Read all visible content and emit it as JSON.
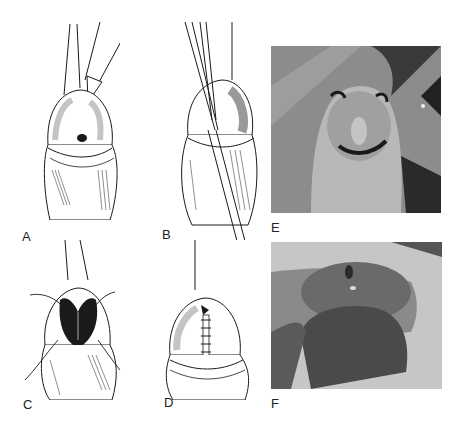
{
  "figure": {
    "panels": [
      {
        "id": "A",
        "label": "A",
        "type": "illustration",
        "description": "Instrument inserted at meatus with forceps and scalpel"
      },
      {
        "id": "B",
        "label": "B",
        "type": "illustration",
        "description": "Forceps spreading ventral incision"
      },
      {
        "id": "C",
        "label": "C",
        "type": "illustration",
        "description": "Opened incision with stay sutures"
      },
      {
        "id": "D",
        "label": "D",
        "type": "illustration",
        "description": "Incision closed with interrupted sutures"
      },
      {
        "id": "E",
        "label": "E",
        "type": "photograph",
        "description": "Intraoperative photograph with marked incision lines"
      },
      {
        "id": "F",
        "label": "F",
        "type": "photograph",
        "description": "Postoperative photograph"
      }
    ]
  },
  "colors": {
    "background": "#ffffff",
    "ink": "#1a1a1a",
    "photo_mid": "#8a8a8a",
    "photo_dark": "#3a3a3a",
    "photo_light": "#c8c8c8"
  }
}
